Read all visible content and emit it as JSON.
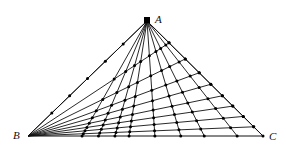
{
  "diagram": {
    "type": "triangle-cevian-grid",
    "vertices": {
      "A": {
        "label": "A",
        "x": 147,
        "y": 21
      },
      "B": {
        "label": "B",
        "x": 28,
        "y": 136
      },
      "C": {
        "label": "C",
        "x": 263,
        "y": 136
      }
    },
    "cevian_params_from_A_on_BC": [
      0.23,
      0.3,
      0.37,
      0.43,
      0.54,
      0.65,
      0.75,
      0.89,
      1.0
    ],
    "cevian_params_from_B_on_CA": [
      0.0,
      0.19,
      0.33,
      0.45,
      0.55,
      0.65,
      0.74,
      0.83,
      0.92
    ],
    "colors": {
      "line": "#111111",
      "dot": "#000000",
      "background": "#ffffff"
    }
  }
}
